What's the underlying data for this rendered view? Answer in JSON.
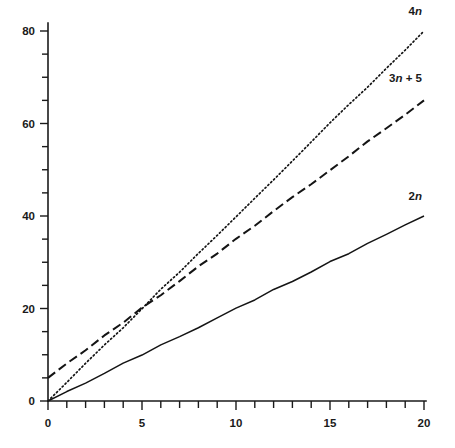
{
  "chart_data": {
    "type": "line",
    "title": "",
    "subtitle": "",
    "xlabel": "",
    "ylabel": "",
    "xlim": [
      0,
      20
    ],
    "ylim": [
      0,
      80
    ],
    "grid": false,
    "legend_position": "inline-right-end-of-line",
    "background_color": "#ffffff",
    "line_color": "#141414",
    "x_ticks_major": [
      0,
      5,
      10,
      15,
      20
    ],
    "x_tick_labels": [
      "0",
      "5",
      "10",
      "15",
      "20"
    ],
    "x_ticks_minor_step": 1,
    "y_ticks_major": [
      0,
      20,
      40,
      60,
      80
    ],
    "y_tick_labels": [
      "0",
      "20",
      "40",
      "60",
      "80"
    ],
    "y_ticks_minor_step": 5,
    "x": [
      0,
      1,
      2,
      3,
      4,
      5,
      6,
      7,
      8,
      9,
      10,
      11,
      12,
      13,
      14,
      15,
      16,
      17,
      18,
      19,
      20
    ],
    "series": [
      {
        "name": "4n",
        "label_prefix": "4",
        "label_variable": "n",
        "label_suffix": "",
        "style": "dotted",
        "slope": 4,
        "intercept": 0,
        "values": [
          0,
          4,
          8,
          12,
          16,
          20,
          24,
          28,
          32,
          36,
          40,
          44,
          48,
          52,
          56,
          60,
          64,
          68,
          72,
          76,
          80
        ]
      },
      {
        "name": "3n + 5",
        "label_prefix": "3",
        "label_variable": "n",
        "label_suffix": " + 5",
        "style": "dashed",
        "slope": 3,
        "intercept": 5,
        "values": [
          5,
          8,
          11,
          14,
          17,
          20,
          23,
          26,
          29,
          32,
          35,
          38,
          41,
          44,
          47,
          50,
          53,
          56,
          59,
          62,
          65
        ]
      },
      {
        "name": "2n",
        "label_prefix": "2",
        "label_variable": "n",
        "label_suffix": "",
        "style": "solid",
        "slope": 2,
        "intercept": 0,
        "values": [
          0,
          2,
          4,
          6,
          8,
          10,
          12,
          14,
          16,
          18,
          20,
          22,
          24,
          26,
          28,
          30,
          32,
          34,
          36,
          38,
          40
        ]
      }
    ],
    "annotations": [
      {
        "text": "4n",
        "at_x": 20,
        "at_y": 80,
        "note": "series end label"
      },
      {
        "text": "3n + 5",
        "at_x": 20,
        "at_y": 65,
        "note": "series end label"
      },
      {
        "text": "2n",
        "at_x": 20,
        "at_y": 40,
        "note": "series end label"
      }
    ]
  }
}
